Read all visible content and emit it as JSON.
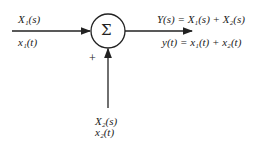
{
  "diagram": {
    "type": "summing-junction block diagram",
    "summing_symbol": "Σ",
    "inputs": [
      {
        "id": "x1",
        "laplace_label": "X₁(s)",
        "time_label": "x₁(t)",
        "direction": "left"
      },
      {
        "id": "x2",
        "laplace_label": "X₂(s)",
        "time_label": "x₂(t)",
        "direction": "bottom",
        "sign": "+"
      }
    ],
    "output": {
      "laplace_label": "Y(s) = X₁(s) + X₂(s)",
      "time_label": "y(t) = x₁(t) + x₂(t)"
    }
  }
}
